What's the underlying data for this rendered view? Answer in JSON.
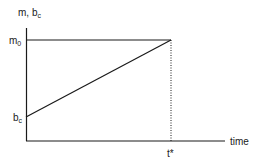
{
  "diagram": {
    "y_axis_label": "m, b",
    "y_axis_label_sub": "c",
    "x_axis_label": "time",
    "m0_label": "m",
    "m0_sub": "0",
    "bc_label": "b",
    "bc_sub": "c",
    "tstar_label": "t*",
    "line_color": "#1a1a1a"
  }
}
